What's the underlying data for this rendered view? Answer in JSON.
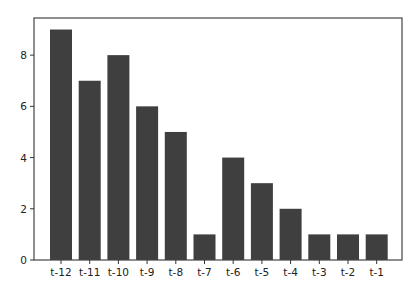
{
  "chart_data": {
    "type": "bar",
    "title": "",
    "xlabel": "",
    "ylabel": "",
    "categories": [
      "t-12",
      "t-11",
      "t-10",
      "t-9",
      "t-8",
      "t-7",
      "t-6",
      "t-5",
      "t-4",
      "t-3",
      "t-2",
      "t-1"
    ],
    "values": [
      9,
      7,
      8,
      6,
      5,
      1,
      4,
      3,
      2,
      1,
      1,
      1
    ],
    "ylim": [
      0,
      9.45
    ],
    "yticks": [
      0,
      2,
      4,
      6,
      8
    ],
    "grid": false,
    "legend": null,
    "bar_color": "#3f3f3f"
  }
}
